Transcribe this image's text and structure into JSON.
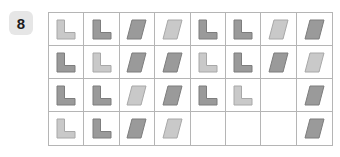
{
  "badge": {
    "label": "8"
  },
  "colors": {
    "dark_fill": "#9a9a9a",
    "dark_stroke": "#7d7d7d",
    "light_fill": "#c9c9c9",
    "light_stroke": "#a8a8a8",
    "grid_line": "#b5b5b5",
    "badge_bg": "#e6e6e6",
    "badge_text": "#1c1c1c",
    "page_bg": "#ffffff"
  },
  "grid": {
    "rows": 4,
    "columns": 8,
    "cells": [
      [
        {
          "shape": "l-shape",
          "tone": "light"
        },
        {
          "shape": "l-shape",
          "tone": "dark"
        },
        {
          "shape": "parallelogram",
          "tone": "dark"
        },
        {
          "shape": "parallelogram",
          "tone": "light"
        },
        {
          "shape": "l-shape",
          "tone": "dark"
        },
        {
          "shape": "l-shape",
          "tone": "dark"
        },
        {
          "shape": "parallelogram",
          "tone": "light"
        },
        {
          "shape": "parallelogram",
          "tone": "dark"
        }
      ],
      [
        {
          "shape": "l-shape",
          "tone": "dark"
        },
        {
          "shape": "l-shape",
          "tone": "light"
        },
        {
          "shape": "parallelogram",
          "tone": "dark"
        },
        {
          "shape": "parallelogram",
          "tone": "dark"
        },
        {
          "shape": "l-shape",
          "tone": "light"
        },
        {
          "shape": "l-shape",
          "tone": "dark"
        },
        {
          "shape": "parallelogram",
          "tone": "dark"
        },
        {
          "shape": "parallelogram",
          "tone": "light"
        }
      ],
      [
        {
          "shape": "l-shape",
          "tone": "dark"
        },
        {
          "shape": "l-shape",
          "tone": "dark"
        },
        {
          "shape": "parallelogram",
          "tone": "light"
        },
        {
          "shape": "parallelogram",
          "tone": "dark"
        },
        {
          "shape": "l-shape",
          "tone": "dark"
        },
        {
          "shape": "l-shape",
          "tone": "light"
        },
        {
          "shape": "empty",
          "tone": "none"
        },
        {
          "shape": "parallelogram",
          "tone": "dark"
        }
      ],
      [
        {
          "shape": "l-shape",
          "tone": "light"
        },
        {
          "shape": "l-shape",
          "tone": "dark"
        },
        {
          "shape": "parallelogram",
          "tone": "dark"
        },
        {
          "shape": "parallelogram",
          "tone": "light"
        },
        {
          "shape": "empty",
          "tone": "none"
        },
        {
          "shape": "empty",
          "tone": "none"
        },
        {
          "shape": "empty",
          "tone": "none"
        },
        {
          "shape": "parallelogram",
          "tone": "dark"
        }
      ]
    ]
  }
}
